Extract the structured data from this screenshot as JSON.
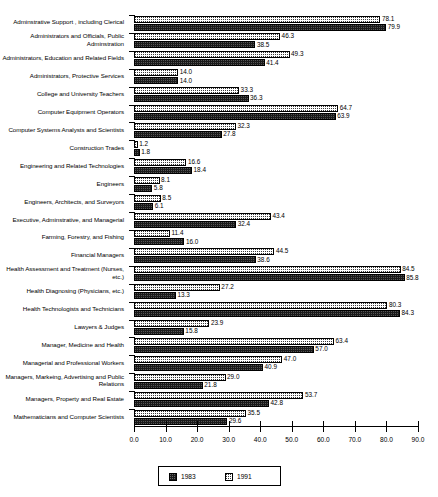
{
  "chart_data": {
    "type": "bar",
    "orientation": "horizontal",
    "title": "",
    "subtitle": "",
    "xlabel": "",
    "ylabel": "",
    "xlim": [
      0.0,
      90.0
    ],
    "xticks": [
      "0.0",
      "10.0",
      "20.0",
      "30.0",
      "40.0",
      "50.0",
      "60.0",
      "70.0",
      "80.0",
      "90.0"
    ],
    "xtick_values": [
      0,
      10,
      20,
      30,
      40,
      50,
      60,
      70,
      80,
      90
    ],
    "grid": false,
    "legend_position": "bottom-center",
    "legend": [
      "1983",
      "1991"
    ],
    "series": [
      {
        "name": "1983",
        "style": "solid-dark",
        "values": [
          79.9,
          38.5,
          41.4,
          14.0,
          36.3,
          63.9,
          27.8,
          1.8,
          18.4,
          5.8,
          6.1,
          32.4,
          16.0,
          38.6,
          85.8,
          13.3,
          84.3,
          15.8,
          57.0,
          40.9,
          21.8,
          42.8,
          29.6
        ]
      },
      {
        "name": "1991",
        "style": "dotted-light",
        "values": [
          78.1,
          46.3,
          49.3,
          14.0,
          33.3,
          64.7,
          32.3,
          1.2,
          16.6,
          8.1,
          8.5,
          43.4,
          11.4,
          44.5,
          84.5,
          27.2,
          80.3,
          23.9,
          63.4,
          47.0,
          29.0,
          53.7,
          35.5
        ]
      }
    ],
    "categories": [
      "Adminstrative Support , including Clerical",
      "Administrators and Officials, Public Adminstration",
      "Administrators, Education and Related Fields",
      "Administrators, Protective Services",
      "College and University Teachers",
      "Computer Equipment Operators",
      "Computer Systems Analysts and Scientists",
      "Construction Trades",
      "Engineering and Related Technologies",
      "Engineers",
      "Engineers, Architects, and Surveyors",
      "Executive, Adminstrative, and Managerial",
      "Farming, Forestry, and Fishing",
      "Financial Managers",
      "Health Assessment and Treatment (Nurses, etc.)",
      "Health Diagnosing (Physicians, etc.)",
      "Health Technologists and Technicians",
      "Lawyers & Judges",
      "Manager, Medicine and Health",
      "Managerial and Professional Workers",
      "Managers, Markeing, Advertising and Public Relations",
      "Managers, Property and Real Estate",
      "Mathematicians and Computer Scientists"
    ],
    "value_labels_1983": [
      "79.9",
      "38.5",
      "41.4",
      "14.0",
      "36.3",
      "63.9",
      "27.8",
      "1.8",
      "18.4",
      "5.8",
      "6.1",
      "32.4",
      "16.0",
      "38.6",
      "85.8",
      "13.3",
      "84.3",
      "15.8",
      "57.0",
      "40.9",
      "21.8",
      "42.8",
      "29.6"
    ],
    "value_labels_1991": [
      "78.1",
      "46.3",
      "49.3",
      "14.0",
      "33.3",
      "64.7",
      "32.3",
      "1.2",
      "16.6",
      "8.1",
      "8.5",
      "43.4",
      "11.4",
      "44.5",
      "84.5",
      "27.2",
      "80.3",
      "23.9",
      "63.4",
      "47.0",
      "29.0",
      "53.7",
      "35.5"
    ],
    "colors": {
      "series_1983": "#1a1a1a",
      "series_1991": "#ffffff",
      "axis": "#000000",
      "background": "#ffffff"
    }
  }
}
